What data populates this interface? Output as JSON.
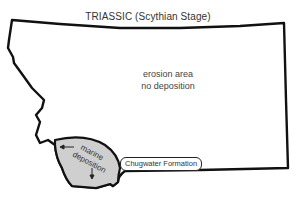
{
  "map": {
    "title": "TRIASSIC  (Scythian Stage)",
    "region": "Montana",
    "labels": {
      "erosion_line1": "erosion area",
      "erosion_line2": "no deposition",
      "marine_line1": "marine",
      "marine_line2": "deposition",
      "formation": "Chugwater Formation"
    },
    "colors": {
      "outline": "#111111",
      "marine_fill": "#cfcfcf",
      "background": "#ffffff"
    }
  }
}
